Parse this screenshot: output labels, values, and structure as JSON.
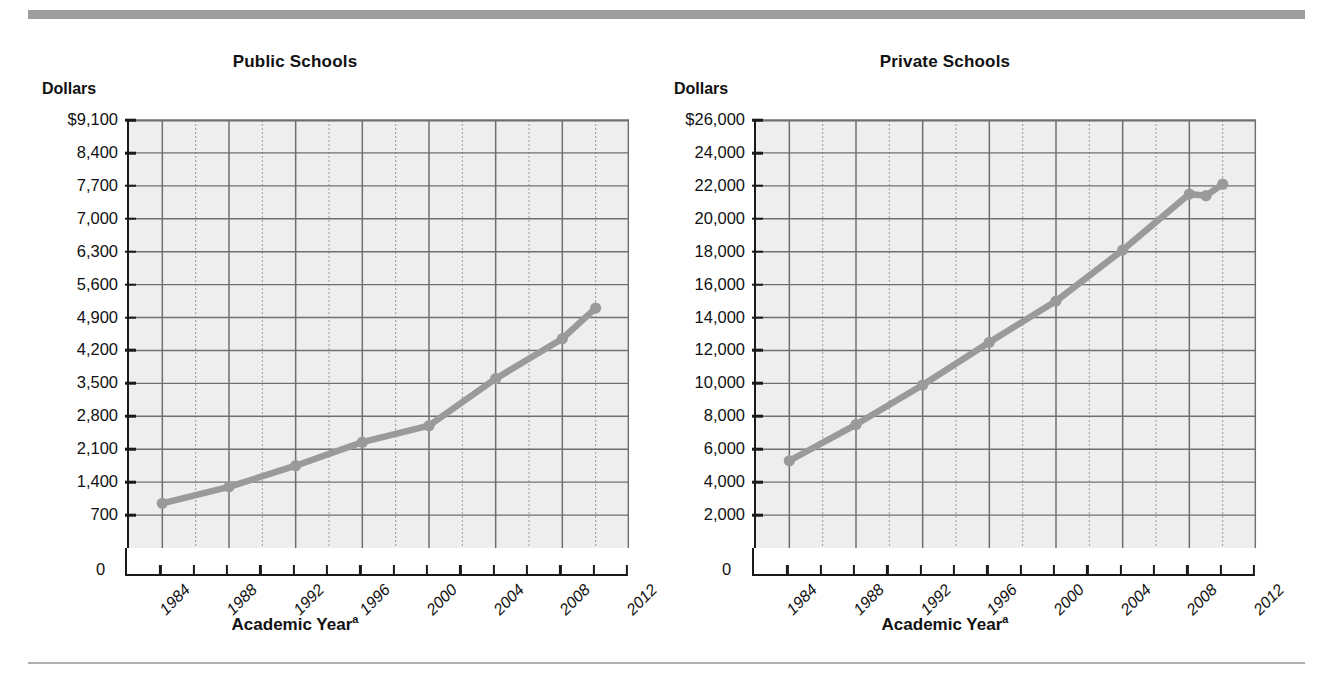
{
  "figure": {
    "top_rule_color": "#9e9e9e",
    "bottom_rule_color": "#b0b0b0",
    "plot_background": "#eeeeee",
    "series_color": "#9a9a9a",
    "axis_color": "#1a1a1a"
  },
  "panels": [
    {
      "title": "Public Schools",
      "y_unit": "Dollars",
      "x_label": "Academic Year",
      "x_label_note": "a",
      "zero_label": "0",
      "y_ticks": [
        "$9,100",
        "8,400",
        "7,700",
        "7,000",
        "6,300",
        "5,600",
        "4,900",
        "4,200",
        "3,500",
        "2,800",
        "2,100",
        "1,400",
        "700"
      ],
      "x_ticks": [
        "1984",
        "1988",
        "1992",
        "1996",
        "2000",
        "2004",
        "2008",
        "2012"
      ]
    },
    {
      "title": "Private Schools",
      "y_unit": "Dollars",
      "x_label": "Academic Year",
      "x_label_note": "a",
      "zero_label": "0",
      "y_ticks": [
        "$26,000",
        "24,000",
        "22,000",
        "20,000",
        "18,000",
        "16,000",
        "14,000",
        "12,000",
        "10,000",
        "8,000",
        "6,000",
        "4,000",
        "2,000"
      ],
      "x_ticks": [
        "1984",
        "1988",
        "1992",
        "1996",
        "2000",
        "2004",
        "2008",
        "2012"
      ]
    }
  ],
  "chart_data": [
    {
      "type": "line",
      "title": "Public Schools",
      "xlabel": "Academic Year",
      "ylabel": "Dollars",
      "xlim": [
        1982,
        2012
      ],
      "ylim": [
        0,
        9100
      ],
      "ytick_values": [
        700,
        1400,
        2100,
        2800,
        3500,
        4200,
        4900,
        5600,
        6300,
        7000,
        7700,
        8400,
        9100
      ],
      "ytick_labels": [
        "700",
        "1,400",
        "2,100",
        "2,800",
        "3,500",
        "4,200",
        "4,900",
        "5,600",
        "6,300",
        "7,000",
        "7,700",
        "8,400",
        "$9,100"
      ],
      "xtick_values": [
        1984,
        1988,
        1992,
        1996,
        2000,
        2004,
        2008,
        2012
      ],
      "xtick_labels": [
        "1984",
        "1988",
        "1992",
        "1996",
        "2000",
        "2004",
        "2008",
        "2012"
      ],
      "grid": true,
      "legend": "none",
      "x": [
        1984,
        1988,
        1992,
        1996,
        2000,
        2004,
        2008,
        2010
      ],
      "values": [
        950,
        1300,
        1750,
        2250,
        2600,
        3600,
        4450,
        5100
      ],
      "markers": true
    },
    {
      "type": "line",
      "title": "Private Schools",
      "xlabel": "Academic Year",
      "ylabel": "Dollars",
      "xlim": [
        1982,
        2012
      ],
      "ylim": [
        0,
        26000
      ],
      "ytick_values": [
        2000,
        4000,
        6000,
        8000,
        10000,
        12000,
        14000,
        16000,
        18000,
        20000,
        22000,
        24000,
        26000
      ],
      "ytick_labels": [
        "2,000",
        "4,000",
        "6,000",
        "8,000",
        "10,000",
        "12,000",
        "14,000",
        "16,000",
        "18,000",
        "20,000",
        "22,000",
        "24,000",
        "$26,000"
      ],
      "xtick_values": [
        1984,
        1988,
        1992,
        1996,
        2000,
        2004,
        2008,
        2012
      ],
      "xtick_labels": [
        "1984",
        "1988",
        "1992",
        "1996",
        "2000",
        "2004",
        "2008",
        "2012"
      ],
      "grid": true,
      "legend": "none",
      "x": [
        1984,
        1988,
        1992,
        1996,
        2000,
        2004,
        2008,
        2009,
        2010
      ],
      "values": [
        5300,
        7500,
        9900,
        12500,
        15000,
        18100,
        21500,
        21400,
        22100
      ],
      "markers": true
    }
  ]
}
